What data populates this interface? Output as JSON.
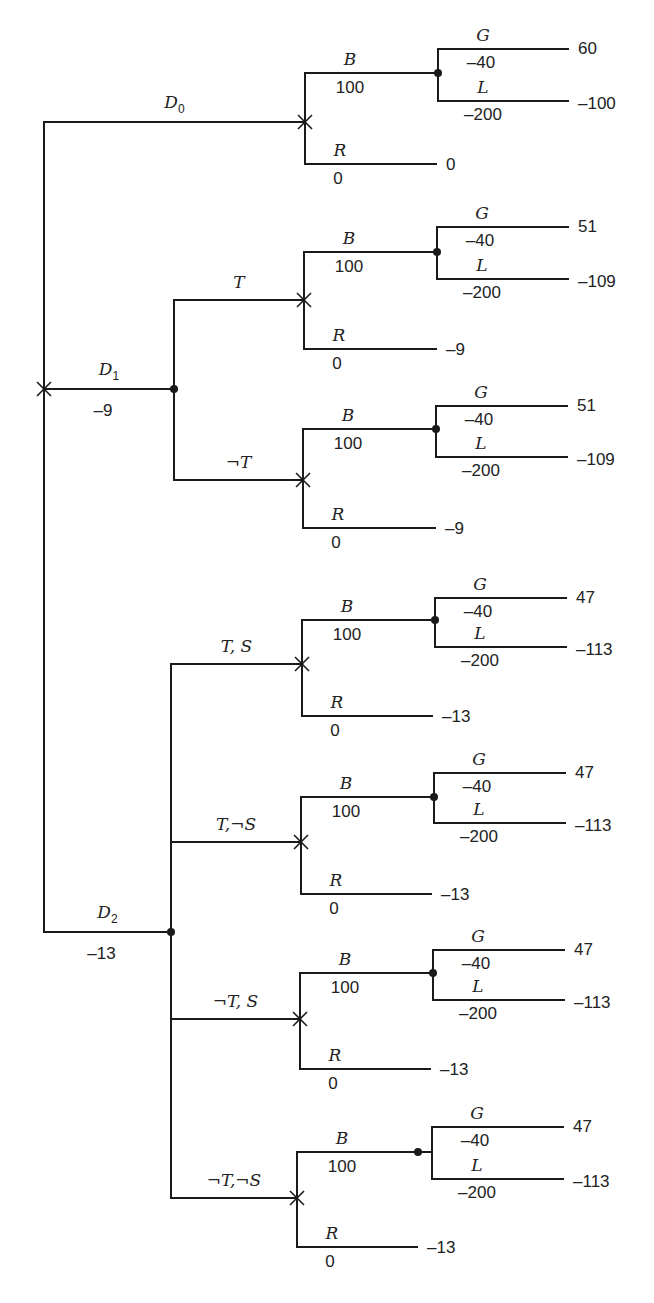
{
  "diagram": {
    "type": "decision-tree",
    "root": {
      "x": 44,
      "top_y": 122,
      "bottom_y": 932,
      "marker": "decision-x",
      "marker_y": 389
    },
    "decisions": [
      {
        "id": "D0",
        "label": "D",
        "sub": "0",
        "cost": "",
        "y": 122,
        "x_end": 305,
        "node": "decision-x",
        "branches": [
          {
            "label": "",
            "y": 122,
            "subtree_index": 0
          }
        ]
      },
      {
        "id": "D1",
        "label": "D",
        "sub": "1",
        "cost": "-9",
        "y": 389,
        "x_end": 174,
        "node": "chance-dot",
        "branches": [
          {
            "label": "T",
            "y": 300,
            "subtree_index": 1
          },
          {
            "label": "¬T",
            "y": 480,
            "subtree_index": 2
          }
        ]
      },
      {
        "id": "D2",
        "label": "D",
        "sub": "2",
        "cost": "-13",
        "y": 932,
        "x_end": 171,
        "node": "chance-dot",
        "branches": [
          {
            "label": "T,  S",
            "y": 664,
            "subtree_index": 3
          },
          {
            "label": "T,¬S",
            "y": 842,
            "subtree_index": 4
          },
          {
            "label": "¬T,  S",
            "y": 1019,
            "subtree_index": 5
          },
          {
            "label": "¬T,¬S",
            "y": 1198,
            "subtree_index": 6
          }
        ]
      }
    ],
    "subtrees": [
      {
        "x_node": 305,
        "y_node": 122,
        "b_y": 73,
        "r_y": 164,
        "chance_x": 438,
        "g_y": 49,
        "l_y": 101,
        "x_right": 568,
        "r_end": 436,
        "B": {
          "label": "B",
          "value": "100"
        },
        "R": {
          "label": "R",
          "value": "0",
          "outcome": "0"
        },
        "G": {
          "label": "G",
          "value": "-40",
          "outcome": "60"
        },
        "L": {
          "label": "L",
          "value": "-200",
          "outcome": "-100"
        }
      },
      {
        "x_node": 304,
        "y_node": 300,
        "b_y": 252,
        "r_y": 349,
        "chance_x": 437,
        "g_y": 227,
        "l_y": 279,
        "x_right": 568,
        "r_end": 436,
        "B": {
          "label": "B",
          "value": "100"
        },
        "R": {
          "label": "R",
          "value": "0",
          "outcome": "-9"
        },
        "G": {
          "label": "G",
          "value": "-40",
          "outcome": "51"
        },
        "L": {
          "label": "L",
          "value": "-200",
          "outcome": "-109"
        }
      },
      {
        "x_node": 303,
        "y_node": 480,
        "b_y": 429,
        "r_y": 528,
        "chance_x": 436,
        "g_y": 406,
        "l_y": 457,
        "x_right": 567,
        "r_end": 435,
        "B": {
          "label": "B",
          "value": "100"
        },
        "R": {
          "label": "R",
          "value": "0",
          "outcome": "-9"
        },
        "G": {
          "label": "G",
          "value": "-40",
          "outcome": "51"
        },
        "L": {
          "label": "L",
          "value": "-200",
          "outcome": "-109"
        }
      },
      {
        "x_node": 302,
        "y_node": 664,
        "b_y": 620,
        "r_y": 716,
        "chance_x": 435,
        "g_y": 598,
        "l_y": 647,
        "x_right": 566,
        "r_end": 432,
        "B": {
          "label": "B",
          "value": "100"
        },
        "R": {
          "label": "R",
          "value": "0",
          "outcome": "-13"
        },
        "G": {
          "label": "G",
          "value": "-40",
          "outcome": "47"
        },
        "L": {
          "label": "L",
          "value": "-200",
          "outcome": "-113"
        }
      },
      {
        "x_node": 301,
        "y_node": 842,
        "b_y": 797,
        "r_y": 894,
        "chance_x": 434,
        "g_y": 773,
        "l_y": 823,
        "x_right": 565,
        "r_end": 431,
        "B": {
          "label": "B",
          "value": "100"
        },
        "R": {
          "label": "R",
          "value": "0",
          "outcome": "-13"
        },
        "G": {
          "label": "G",
          "value": "-40",
          "outcome": "47"
        },
        "L": {
          "label": "L",
          "value": "-200",
          "outcome": "-113"
        }
      },
      {
        "x_node": 300,
        "y_node": 1019,
        "b_y": 973,
        "r_y": 1069,
        "chance_x": 433,
        "g_y": 950,
        "l_y": 1000,
        "x_right": 564,
        "r_end": 430,
        "B": {
          "label": "B",
          "value": "100"
        },
        "R": {
          "label": "R",
          "value": "0",
          "outcome": "-13"
        },
        "G": {
          "label": "G",
          "value": "-40",
          "outcome": "47"
        },
        "L": {
          "label": "L",
          "value": "-200",
          "outcome": "-113"
        }
      },
      {
        "x_node": 297,
        "y_node": 1198,
        "b_y": 1152,
        "r_y": 1247,
        "chance_x": 432,
        "dot_x": 418,
        "g_y": 1127,
        "l_y": 1179,
        "x_right": 563,
        "r_end": 417,
        "B": {
          "label": "B",
          "value": "100"
        },
        "R": {
          "label": "R",
          "value": "0",
          "outcome": "-13"
        },
        "G": {
          "label": "G",
          "value": "-40",
          "outcome": "47"
        },
        "L": {
          "label": "L",
          "value": "-200",
          "outcome": "-113"
        }
      }
    ]
  }
}
